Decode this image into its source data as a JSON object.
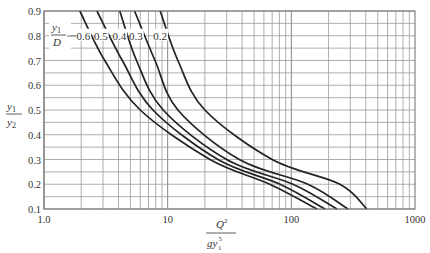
{
  "chart_data": {
    "type": "line",
    "title": "",
    "xlabel": "Q^2 / (g y1^5)",
    "ylabel": "y1 / y2",
    "xscale": "log",
    "xlim": [
      1,
      1000
    ],
    "ylim": [
      0.1,
      0.9
    ],
    "x_ticks": [
      "1.0",
      "10",
      "100",
      "1000"
    ],
    "y_ticks": [
      "0.9",
      "0.8",
      "0.7",
      "0.6",
      "0.5",
      "0.4",
      "0.3",
      "0.2",
      "0.1"
    ],
    "grid": true,
    "legend_title": "y1/D",
    "series": [
      {
        "name": "0.6",
        "points": [
          [
            1.95,
            0.9
          ],
          [
            3.1,
            0.7
          ],
          [
            6.0,
            0.5
          ],
          [
            22,
            0.3
          ],
          [
            67,
            0.2
          ],
          [
            161,
            0.1
          ]
        ]
      },
      {
        "name": "0.5",
        "points": [
          [
            2.68,
            0.9
          ],
          [
            4.3,
            0.7
          ],
          [
            7.6,
            0.5
          ],
          [
            25.5,
            0.3
          ],
          [
            81,
            0.2
          ],
          [
            187,
            0.1
          ]
        ]
      },
      {
        "name": "0.4",
        "points": [
          [
            4.1,
            0.9
          ],
          [
            5.6,
            0.7
          ],
          [
            9.2,
            0.5
          ],
          [
            30,
            0.3
          ],
          [
            103,
            0.2
          ],
          [
            234,
            0.1
          ]
        ]
      },
      {
        "name": "0.3",
        "points": [
          [
            5.4,
            0.9
          ],
          [
            7.9,
            0.7
          ],
          [
            12.1,
            0.5
          ],
          [
            38,
            0.3
          ],
          [
            136,
            0.2
          ],
          [
            287,
            0.1
          ]
        ]
      },
      {
        "name": "0.2",
        "points": [
          [
            8.7,
            0.9
          ],
          [
            12.1,
            0.7
          ],
          [
            20,
            0.5
          ],
          [
            70,
            0.3
          ],
          [
            247,
            0.2
          ],
          [
            408,
            0.1
          ]
        ]
      }
    ]
  },
  "labels": {
    "y_axis_num": "y",
    "y_axis_num_sub": "1",
    "y_axis_den": "y",
    "y_axis_den_sub": "2",
    "x_axis_num": "Q",
    "x_axis_num_sup": "2",
    "x_axis_den": "gy",
    "x_axis_den_sup": "5",
    "x_axis_den_sub": "1",
    "legend_num": "y",
    "legend_num_sub": "1",
    "legend_den": "D"
  }
}
